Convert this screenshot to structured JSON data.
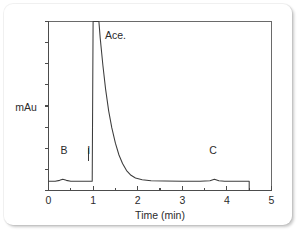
{
  "chart_data": {
    "type": "line",
    "title": "",
    "subtitle": "",
    "xlabel": "Time (min)",
    "ylabel": "mAu",
    "xlim": [
      0,
      5
    ],
    "ylim": [
      0,
      1
    ],
    "grid": false,
    "legend": "none",
    "x_ticks": [
      "0",
      "1",
      "2",
      "3",
      "4",
      "5"
    ],
    "x_tick_values": [
      0,
      1,
      2,
      3,
      4,
      5
    ],
    "x_minor_tick_values": [
      0.5,
      1.5,
      2.5,
      3.5,
      4.5
    ],
    "y_ticks_labeled": false,
    "y_tick_count": 9,
    "annotations": [
      {
        "label": "Ace.",
        "x": 1.25,
        "note": "main acetone peak, clipped at detector full scale"
      },
      {
        "label": "B",
        "x": 0.35,
        "note": "small baseline bump before injection"
      },
      {
        "label": "I",
        "x": 0.9,
        "note": "injection marker"
      },
      {
        "label": "C",
        "x": 3.7,
        "note": "small late-eluting bump"
      }
    ],
    "series": [
      {
        "name": "Detector signal",
        "points": [
          [
            0.0,
            0.055
          ],
          [
            0.15,
            0.055
          ],
          [
            0.25,
            0.06
          ],
          [
            0.32,
            0.066
          ],
          [
            0.4,
            0.06
          ],
          [
            0.5,
            0.055
          ],
          [
            0.7,
            0.055
          ],
          [
            0.88,
            0.055
          ],
          [
            0.98,
            0.055
          ],
          [
            1.0,
            1.0
          ],
          [
            1.13,
            1.0
          ],
          [
            1.16,
            0.9
          ],
          [
            1.22,
            0.74
          ],
          [
            1.28,
            0.6
          ],
          [
            1.35,
            0.47
          ],
          [
            1.42,
            0.37
          ],
          [
            1.5,
            0.28
          ],
          [
            1.58,
            0.21
          ],
          [
            1.66,
            0.16
          ],
          [
            1.75,
            0.118
          ],
          [
            1.85,
            0.09
          ],
          [
            1.95,
            0.074
          ],
          [
            2.1,
            0.064
          ],
          [
            2.3,
            0.058
          ],
          [
            2.6,
            0.056
          ],
          [
            3.0,
            0.055
          ],
          [
            3.4,
            0.055
          ],
          [
            3.62,
            0.058
          ],
          [
            3.72,
            0.066
          ],
          [
            3.82,
            0.058
          ],
          [
            3.95,
            0.055
          ],
          [
            4.3,
            0.055
          ],
          [
            4.5,
            0.055
          ],
          [
            4.5,
            0.0
          ]
        ]
      }
    ],
    "marker_lines": [
      {
        "label": "I",
        "x": 0.9,
        "y_top": 0.115,
        "y_bottom": 0.055
      }
    ]
  },
  "figure": {
    "y_axis_label": "mAu",
    "x_axis_label": "Time (min)",
    "peak_label": "Ace.",
    "marker_b": "B",
    "marker_i": "I",
    "marker_c": "C",
    "tick_0": "0",
    "tick_1": "1",
    "tick_2": "2",
    "tick_3": "3",
    "tick_4": "4",
    "tick_5": "5"
  },
  "colors": {
    "background": "#ffffff",
    "trace": "#3c3c3c",
    "axis": "#4c4c4c",
    "frame": "#6a6a6a",
    "text": "#2b2b2b"
  }
}
